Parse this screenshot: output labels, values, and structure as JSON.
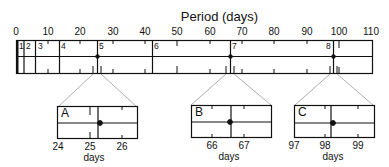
{
  "title": "Period  (days)",
  "axis": {
    "min": 0,
    "max": 110,
    "ticks": [
      "0",
      "10",
      "20",
      "30",
      "40",
      "50",
      "60",
      "70",
      "80",
      "90",
      "100",
      "110"
    ]
  },
  "segments": [
    {
      "label": "1",
      "boundary": 0.5
    },
    {
      "label": "2",
      "boundary": 2.5
    },
    {
      "label": "3",
      "boundary": 6
    },
    {
      "label": "4",
      "boundary": 13.5
    },
    {
      "label": "5",
      "boundary": 25.3
    },
    {
      "label": "6",
      "boundary": 42.5
    },
    {
      "label": "7",
      "boundary": 66.6
    },
    {
      "label": "8",
      "boundary": 98.2
    }
  ],
  "insets": [
    {
      "label": "A",
      "ticks": [
        "24",
        "25",
        "26"
      ],
      "unit": "days",
      "center": 25.3
    },
    {
      "label": "B",
      "ticks": [
        "66",
        "67"
      ],
      "unit": "days",
      "center": 66.6
    },
    {
      "label": "C",
      "ticks": [
        "97",
        "98",
        "99"
      ],
      "unit": "days",
      "center": 98.2
    }
  ],
  "colors": {
    "line": "#111111",
    "connector": "#999999"
  }
}
